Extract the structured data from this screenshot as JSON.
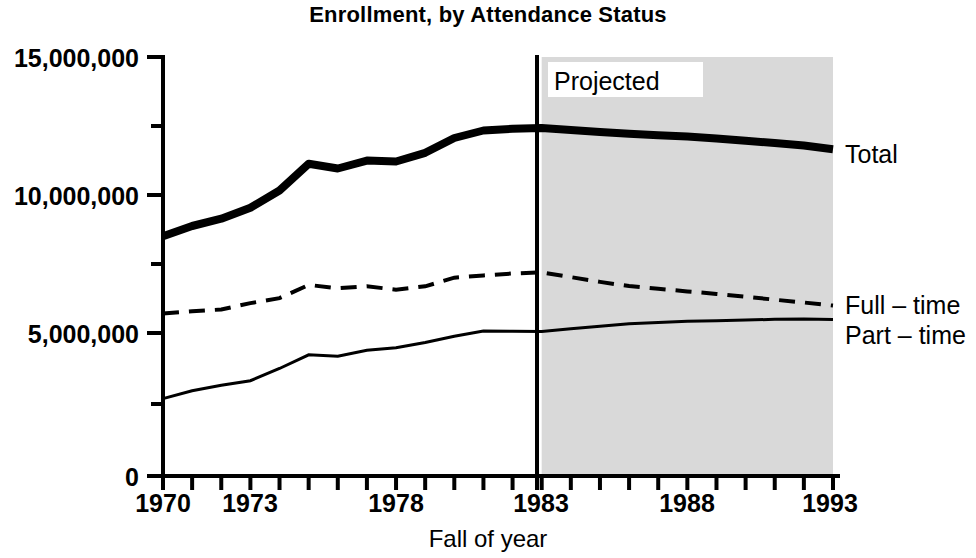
{
  "chart_data": {
    "type": "line",
    "title": "Enrollment, by Attendance Status",
    "xlabel": "Fall of year",
    "ylabel": "",
    "xlim": [
      1970,
      1993
    ],
    "ylim": [
      0,
      15000000
    ],
    "grid": false,
    "legend_position": "right-of-plot (inline series labels)",
    "x": [
      1970,
      1971,
      1972,
      1973,
      1974,
      1975,
      1976,
      1977,
      1978,
      1979,
      1980,
      1981,
      1982,
      1983,
      1984,
      1985,
      1986,
      1987,
      1988,
      1989,
      1990,
      1991,
      1992,
      1993
    ],
    "series": [
      {
        "name": "Total",
        "style": "thick-solid",
        "values": [
          8580000,
          8950000,
          9210000,
          9600000,
          10220000,
          11180000,
          11010000,
          11290000,
          11260000,
          11570000,
          12100000,
          12370000,
          12430000,
          12460000,
          12390000,
          12310000,
          12250000,
          12200000,
          12150000,
          12080000,
          12000000,
          11920000,
          11830000,
          11700000
        ]
      },
      {
        "name": "Full – time",
        "style": "dashed",
        "values": [
          5820000,
          5900000,
          5960000,
          6190000,
          6370000,
          6840000,
          6720000,
          6790000,
          6670000,
          6790000,
          7100000,
          7180000,
          7250000,
          7290000,
          7120000,
          6950000,
          6800000,
          6700000,
          6610000,
          6520000,
          6420000,
          6310000,
          6210000,
          6100000
        ]
      },
      {
        "name": "Part – time",
        "style": "thin-solid",
        "values": [
          2770000,
          3050000,
          3250000,
          3410000,
          3850000,
          4340000,
          4290000,
          4500000,
          4590000,
          4780000,
          5000000,
          5190000,
          5180000,
          5170000,
          5270000,
          5360000,
          5450000,
          5500000,
          5540000,
          5560000,
          5580000,
          5610000,
          5620000,
          5600000
        ]
      }
    ],
    "y_ticks": [
      {
        "value": 0,
        "label": "0"
      },
      {
        "value": 5000000,
        "label": "5,000,000"
      },
      {
        "value": 10000000,
        "label": "10,000,000"
      },
      {
        "value": 15000000,
        "label": "15,000,000"
      }
    ],
    "y_minor_ticks": [
      2500000,
      7500000,
      12500000
    ],
    "x_ticks": [
      {
        "value": 1970,
        "label": "1970"
      },
      {
        "value": 1973,
        "label": "1973"
      },
      {
        "value": 1978,
        "label": "1978"
      },
      {
        "value": 1983,
        "label": "1983"
      },
      {
        "value": 1988,
        "label": "1988"
      },
      {
        "value": 1993,
        "label": "1993"
      }
    ],
    "annotations": [
      {
        "name": "projected-region",
        "label": "Projected",
        "start_year": 1983,
        "end_year": 1993,
        "shading": "#d9d9d9"
      }
    ]
  },
  "labels": {
    "title": "Enrollment, by Attendance Status",
    "xlabel": "Fall of year",
    "projected": "Projected",
    "series_total": "Total",
    "series_full_time": "Full – time",
    "series_part_time": "Part – time",
    "y0": "0",
    "y5m": "5,000,000",
    "y10m": "10,000,000",
    "y15m": "15,000,000",
    "x1970": "1970",
    "x1973": "1973",
    "x1978": "1978",
    "x1983": "1983",
    "x1988": "1988",
    "x1993": "1993"
  },
  "colors": {
    "ink": "#000000",
    "background": "#ffffff",
    "projected_shade": "#d9d9d9"
  }
}
